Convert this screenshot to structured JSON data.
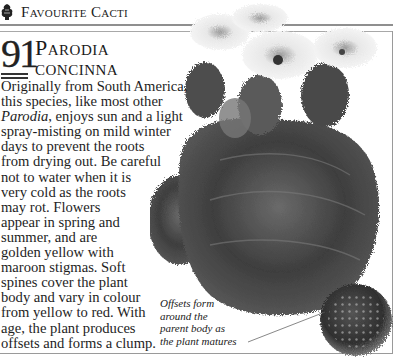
{
  "header": {
    "icon": "cactus-icon",
    "title": "Favourite Cacti"
  },
  "entry": {
    "number": "91",
    "title_line1": "Parodia",
    "title_line2": "concinna"
  },
  "body": {
    "lines": [
      "Originally from South America,",
      "this species, like most other",
      "Parodia",
      ", enjoys sun and a light",
      "spray-misting on mild winter",
      "days to prevent the roots",
      "from drying out. Be careful",
      "not to water when it is",
      "very cold as the roots",
      "may rot. Flowers",
      "appear in spring and",
      "summer, and are",
      "golden yellow with",
      "maroon stigmas. Soft",
      "spines cover the plant",
      "body and vary in colour",
      "from yellow to red. With",
      "age, the plant produces",
      "offsets and forms a clump."
    ]
  },
  "caption": {
    "lines": [
      "Offsets form",
      "around the",
      "parent body as",
      "the plant matures"
    ]
  },
  "image": {
    "subject": "Parodia concinna cactus with flowers and offsets",
    "tone": "grayscale"
  }
}
